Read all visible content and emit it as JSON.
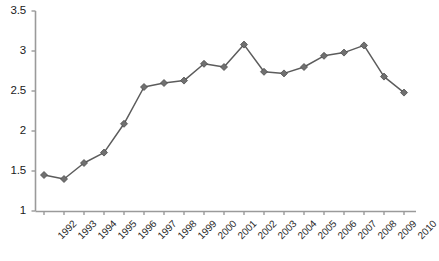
{
  "chart_data": {
    "type": "line",
    "title": "",
    "subtitle": "",
    "xlabel": "",
    "ylabel": "",
    "categories": [
      "1992",
      "1993",
      "1994",
      "1995",
      "1996",
      "1997",
      "1998",
      "1999",
      "2000",
      "2001",
      "2002",
      "2003",
      "2004",
      "2005",
      "2006",
      "2007",
      "2008",
      "2009",
      "2010"
    ],
    "values": [
      1.45,
      1.4,
      1.6,
      1.73,
      2.09,
      2.55,
      2.6,
      2.63,
      2.84,
      2.8,
      3.08,
      2.74,
      2.72,
      2.8,
      2.94,
      2.98,
      3.07,
      2.68,
      2.48
    ],
    "series": [
      {
        "name": "series-1",
        "values": [
          1.45,
          1.4,
          1.6,
          1.73,
          2.09,
          2.55,
          2.6,
          2.63,
          2.84,
          2.8,
          3.08,
          2.74,
          2.72,
          2.8,
          2.94,
          2.98,
          3.07,
          2.68,
          2.48
        ]
      }
    ],
    "ylim": [
      1,
      3.5
    ],
    "ytick_labels": [
      "3.5",
      "3",
      "2.5",
      "2",
      "1.5",
      "1"
    ],
    "ytick_values": [
      3.5,
      3,
      2.5,
      2,
      1.5,
      1
    ],
    "xtick_labels": [
      "1992",
      "1993",
      "1994",
      "1995",
      "1996",
      "1997",
      "1998",
      "1999",
      "2000",
      "2001",
      "2002",
      "2003",
      "2004",
      "2005",
      "2006",
      "2007",
      "2008",
      "2009",
      "2010"
    ],
    "grid": false,
    "legend": "none",
    "marker": "diamond",
    "line_color": "#5c5c5c",
    "marker_color": "#707070",
    "axis_color": "#8a8a8a",
    "background_color": "#ffffff"
  },
  "caption": {
    "text": ""
  }
}
